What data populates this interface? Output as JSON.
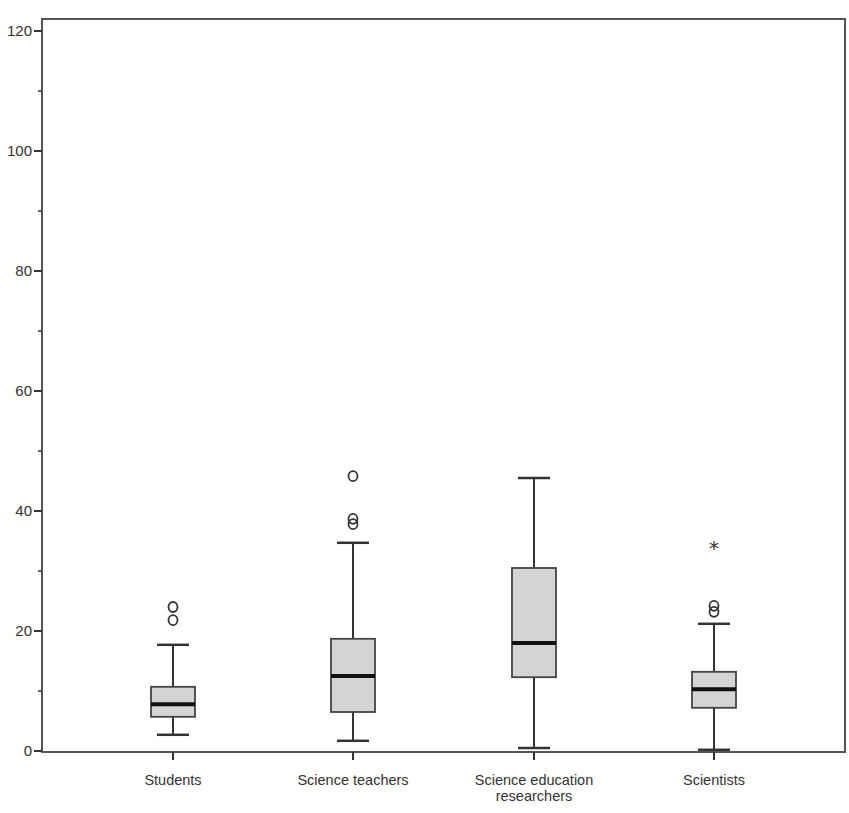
{
  "chart_data": {
    "type": "boxplot",
    "title": "",
    "xlabel": "",
    "ylabel": "",
    "ylim": [
      0,
      120
    ],
    "yticks": [
      0,
      20,
      40,
      60,
      80,
      100,
      120
    ],
    "minor_yticks": [
      10,
      30,
      50,
      70,
      90,
      110
    ],
    "grid": false,
    "legend": null,
    "box_fill": "#d4d4d4",
    "line_color": "#333333",
    "categories": [
      [
        "Students"
      ],
      [
        "Science teachers"
      ],
      [
        "Science education",
        "researchers"
      ],
      [
        "Scientists"
      ]
    ],
    "series": [
      {
        "name": "Students",
        "whisker_low": 2.7,
        "q1": 5.7,
        "median": 7.8,
        "q3": 10.7,
        "whisker_high": 17.7,
        "outliers": [
          21.8,
          24.0
        ],
        "extremes": []
      },
      {
        "name": "Science teachers",
        "whisker_low": 1.7,
        "q1": 6.5,
        "median": 12.5,
        "q3": 18.7,
        "whisker_high": 34.7,
        "outliers": [
          37.8,
          38.7,
          45.8
        ],
        "extremes": []
      },
      {
        "name": "Science education researchers",
        "whisker_low": 0.5,
        "q1": 12.3,
        "median": 18.0,
        "q3": 30.5,
        "whisker_high": 45.5,
        "outliers": [],
        "extremes": []
      },
      {
        "name": "Scientists",
        "whisker_low": 0.2,
        "q1": 7.2,
        "median": 10.3,
        "q3": 13.2,
        "whisker_high": 21.2,
        "outliers": [
          23.2,
          24.2
        ],
        "extremes": [
          34.2
        ]
      }
    ],
    "markers": {
      "outlier": "o",
      "extreme": "*"
    }
  }
}
